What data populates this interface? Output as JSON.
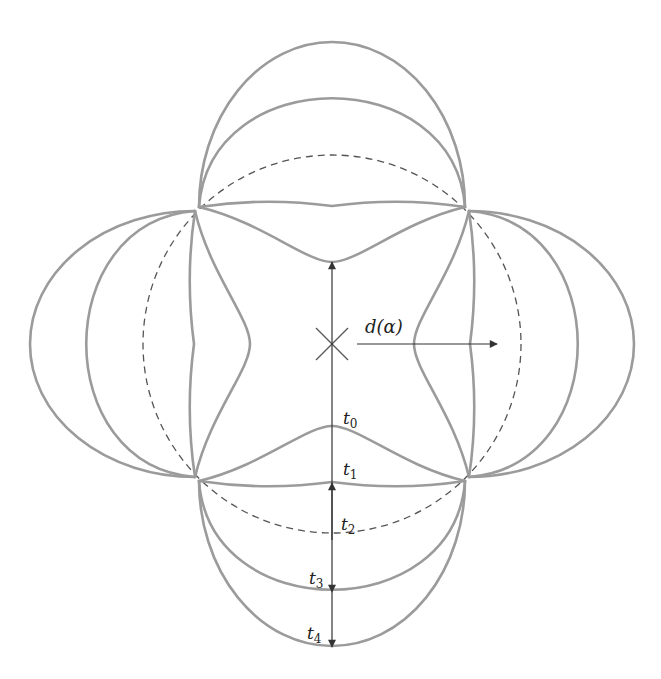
{
  "figure": {
    "center": [
      332,
      344
    ],
    "corners": [
      [
        199,
        207
      ],
      [
        465,
        207
      ],
      [
        465,
        481
      ],
      [
        199,
        481
      ]
    ],
    "colors": {
      "curve": "#9b9b9b",
      "dashed": "#555555",
      "arrow": "#333333",
      "text": "#222222",
      "background": "#ffffff"
    }
  },
  "curves": [
    {
      "id": "t0",
      "label": "t",
      "subscript": "0",
      "style": "solid",
      "offset": -55,
      "note": "inward pinched curve"
    },
    {
      "id": "t1",
      "label": "t",
      "subscript": "1",
      "style": "solid",
      "offset": 0,
      "note": "near-straight wavy edge"
    },
    {
      "id": "t2",
      "label": "t",
      "subscript": "2",
      "style": "dashed",
      "offset": 56,
      "note": "circumscribed circle"
    },
    {
      "id": "t3",
      "label": "t",
      "subscript": "3",
      "style": "solid",
      "offset": 110
    },
    {
      "id": "t4",
      "label": "t",
      "subscript": "4",
      "style": "solid",
      "offset": 165
    }
  ],
  "labels": {
    "d_alpha": "d(α)",
    "t0": {
      "base": "t",
      "sub": "0"
    },
    "t1": {
      "base": "t",
      "sub": "1"
    },
    "t2": {
      "base": "t",
      "sub": "2"
    },
    "t3": {
      "base": "t",
      "sub": "3"
    },
    "t4": {
      "base": "t",
      "sub": "4"
    }
  },
  "center_marker": "cross-mark"
}
